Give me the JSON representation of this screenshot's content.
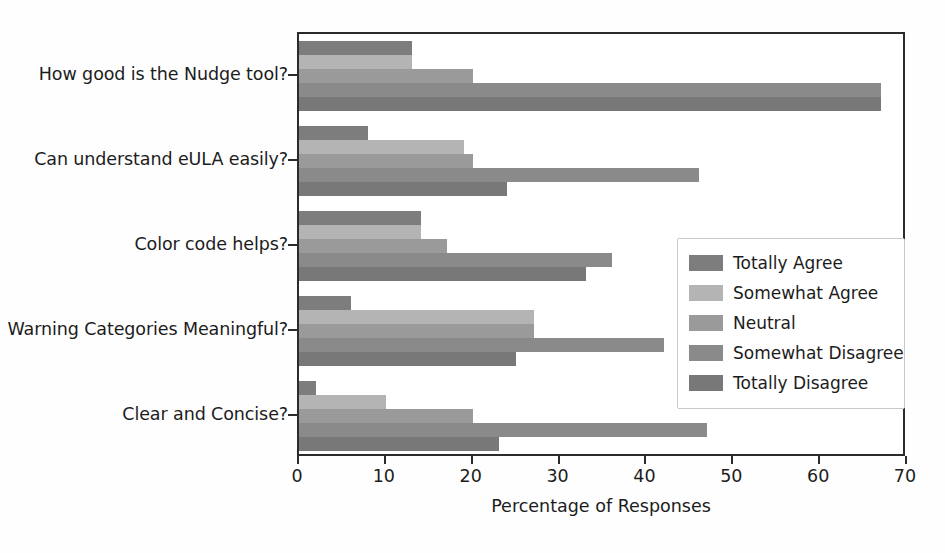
{
  "chart_data": {
    "type": "bar",
    "orientation": "horizontal",
    "title": "",
    "xlabel": "Percentage of Responses",
    "ylabel": "",
    "xlim": [
      0,
      70
    ],
    "xticks": [
      0,
      10,
      20,
      30,
      40,
      50,
      60,
      70
    ],
    "grid": false,
    "legend_position": "center right",
    "categories": [
      "How good is the Nudge tool?",
      "Can understand eULA easily?",
      "Color code helps?",
      "Warning Categories Meaningful?",
      "Clear and Concise?"
    ],
    "series": [
      {
        "name": "Totally Agree",
        "color": "#7d7d7d",
        "values": [
          13,
          8,
          14,
          6,
          2
        ]
      },
      {
        "name": "Somewhat Agree",
        "color": "#b4b4b4",
        "values": [
          13,
          19,
          14,
          27,
          10
        ]
      },
      {
        "name": "Neutral",
        "color": "#9a9a9a",
        "values": [
          20,
          20,
          17,
          27,
          20
        ]
      },
      {
        "name": "Somewhat Disagree",
        "color": "#8a8a8a",
        "values": [
          67,
          46,
          36,
          42,
          47
        ]
      },
      {
        "name": "Totally Disagree",
        "color": "#787878",
        "values": [
          67,
          24,
          33,
          25,
          23
        ]
      }
    ]
  },
  "axis": {
    "x_tick_labels": [
      "0",
      "10",
      "20",
      "30",
      "40",
      "50",
      "60",
      "70"
    ],
    "x_title": "Percentage of Responses"
  },
  "legend": {
    "entries": [
      {
        "label": "Totally Agree",
        "color": "#7d7d7d"
      },
      {
        "label": "Somewhat Agree",
        "color": "#b4b4b4"
      },
      {
        "label": "Neutral",
        "color": "#9a9a9a"
      },
      {
        "label": "Somewhat Disagree",
        "color": "#8a8a8a"
      },
      {
        "label": "Totally Disagree",
        "color": "#787878"
      }
    ]
  }
}
